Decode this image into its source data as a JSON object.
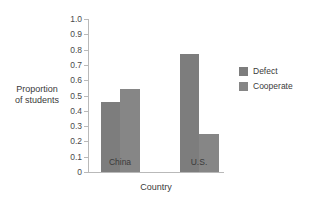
{
  "chart_data": {
    "type": "bar",
    "title": "",
    "xlabel": "Country",
    "ylabel": "Proportion\nof students",
    "categories": [
      "China",
      "U.S."
    ],
    "series": [
      {
        "name": "Defect",
        "values": [
          0.46,
          0.77
        ],
        "color": "#7d7d7d"
      },
      {
        "name": "Cooperate",
        "values": [
          0.54,
          0.25
        ],
        "color": "#868686"
      }
    ],
    "ylim": [
      0,
      1.0
    ],
    "ytick_labels": [
      "0",
      "0.1",
      "0.2",
      "0.3",
      "0.4",
      "0.5",
      "0.6",
      "0.7",
      "0.8",
      "0.9",
      "1.0"
    ],
    "ytick_values": [
      0,
      0.1,
      0.2,
      0.3,
      0.4,
      0.5,
      0.6,
      0.7,
      0.8,
      0.9,
      1.0
    ],
    "grid": false,
    "legend_position": "right",
    "legend_entries": [
      "Defect",
      "Cooperate"
    ],
    "axis_color": "#b9b9b9",
    "background": "#ffffff"
  }
}
